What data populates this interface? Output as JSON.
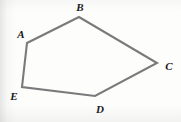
{
  "figure": {
    "kind": "geometry-diagram",
    "shape_name": "pentagon ABCDE",
    "canvas": {
      "width": 181,
      "height": 122
    },
    "background_color": "#fdfdfc",
    "stroke_color": "#7a7a7c",
    "stroke_width": 2.1,
    "label_color": "#16161a",
    "vertices": [
      {
        "id": "A",
        "label": "A",
        "x": 27,
        "y": 43,
        "label_x": 21,
        "label_y": 34
      },
      {
        "id": "B",
        "label": "B",
        "x": 79,
        "y": 17,
        "label_x": 80,
        "label_y": 7
      },
      {
        "id": "C",
        "label": "C",
        "x": 157,
        "y": 63,
        "label_x": 169,
        "label_y": 66
      },
      {
        "id": "D",
        "label": "D",
        "x": 95,
        "y": 96,
        "label_x": 100,
        "label_y": 109
      },
      {
        "id": "E",
        "label": "E",
        "x": 22,
        "y": 87,
        "label_x": 14,
        "label_y": 96
      }
    ],
    "edges": [
      {
        "from": "A",
        "to": "B"
      },
      {
        "from": "B",
        "to": "C"
      },
      {
        "from": "C",
        "to": "D"
      },
      {
        "from": "D",
        "to": "E"
      },
      {
        "from": "E",
        "to": "A"
      }
    ]
  }
}
